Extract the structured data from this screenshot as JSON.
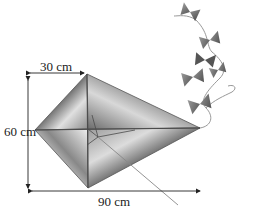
{
  "figure": {
    "dimensions": {
      "top_width": "30 cm",
      "height": "60 cm",
      "total_width": "90 cm"
    }
  },
  "colors": {
    "kite_light": "#e6e6e6",
    "kite_dark": "#7a7a7a",
    "frame": "#555555",
    "arrow": "#222222",
    "bow": "#6e6e6e"
  }
}
